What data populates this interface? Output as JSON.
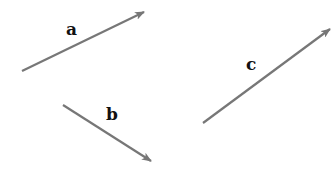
{
  "diagram": {
    "arrow_color": "#777777",
    "label_color": "#111111",
    "vectors": [
      {
        "label": "a",
        "x1": 22,
        "y1": 71,
        "x2": 144,
        "y2": 12,
        "label_x": 66,
        "label_y": 35
      },
      {
        "label": "b",
        "x1": 63,
        "y1": 105,
        "x2": 151,
        "y2": 161,
        "label_x": 106,
        "label_y": 120
      },
      {
        "label": "c",
        "x1": 203,
        "y1": 123,
        "x2": 330,
        "y2": 29,
        "label_x": 246,
        "label_y": 70
      }
    ]
  }
}
